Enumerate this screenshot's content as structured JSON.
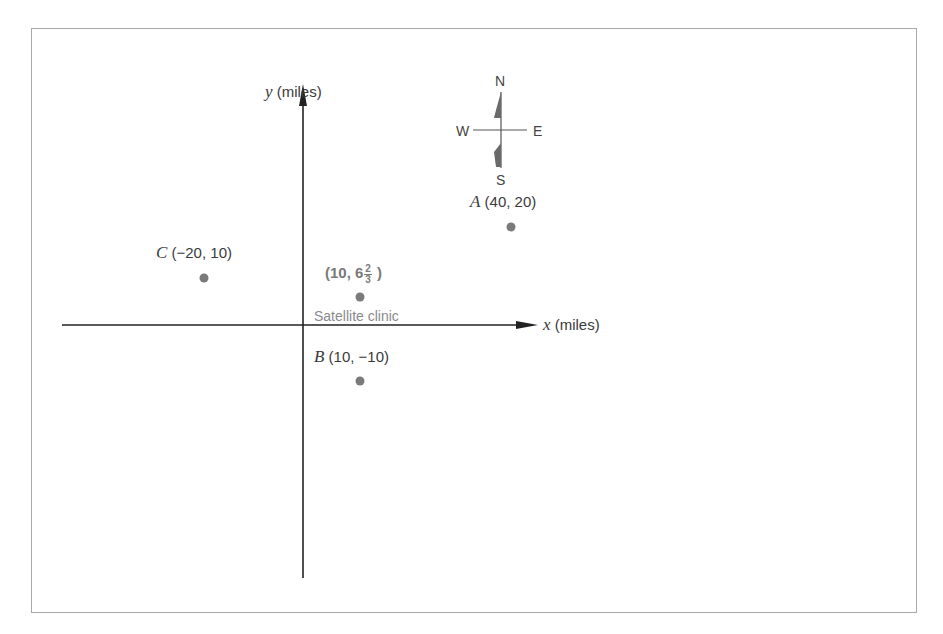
{
  "diagram": {
    "axes": {
      "x_label_var": "x",
      "x_label_unit": "(miles)",
      "y_label_var": "y",
      "y_label_unit": "(miles)"
    },
    "compass": {
      "n": "N",
      "s": "S",
      "e": "E",
      "w": "W"
    },
    "points": [
      {
        "id": "A",
        "letter": "A",
        "coords": "(40, 20)",
        "x": 40,
        "y": 20
      },
      {
        "id": "B",
        "letter": "B",
        "coords": "(10, −10)",
        "x": 10,
        "y": -10
      },
      {
        "id": "C",
        "letter": "C",
        "coords": "(−20, 10)",
        "x": -20,
        "y": 10
      }
    ],
    "clinic": {
      "name": "Satellite clinic",
      "coord_prefix": "(10, 6",
      "frac_num": "2",
      "frac_den": "3",
      "coord_suffix": ")",
      "x": 10,
      "y": 6.667
    },
    "colors": {
      "point": "#7a7a7a",
      "axis": "#222222",
      "frame": "#a8a8a8"
    }
  }
}
